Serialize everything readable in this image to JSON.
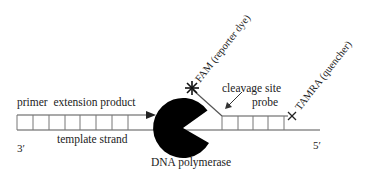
{
  "diagram": {
    "labels": {
      "primer_extension": "primer  extension product",
      "template_strand": "template strand",
      "three_prime": "3′",
      "five_prime": "5′",
      "polymerase": "DNA polymerase",
      "reporter": "FAM (reporter dye)",
      "cleavage": "cleavage site",
      "probe": "probe",
      "quencher": "TAMRA (quencher)"
    },
    "colors": {
      "line": "#555555",
      "polymerase_fill": "#000000",
      "text": "#222222"
    }
  }
}
